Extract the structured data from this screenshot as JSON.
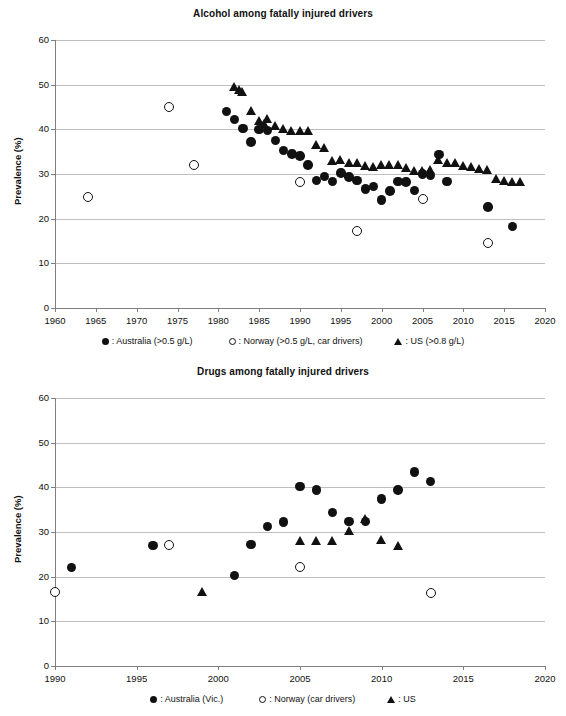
{
  "charts": [
    {
      "id": "alcohol",
      "title": "Alcohol among fatally injured drivers",
      "ylabel": "Prevalence (%)",
      "xlabel": "",
      "ylim": [
        0,
        60
      ],
      "xlim": [
        1960,
        2020
      ],
      "yticks": [
        "0",
        "10",
        "20",
        "30",
        "40",
        "50",
        "60"
      ],
      "xticks": [
        "1960",
        "1965",
        "1970",
        "1975",
        "1980",
        "1985",
        "1990",
        "1995",
        "2000",
        "2005",
        "2010",
        "2015",
        "2020"
      ],
      "legend": [
        {
          "marker": "circle-filled",
          "label": ": Australia (>0.5 g/L)"
        },
        {
          "marker": "circle-open",
          "label": ": Norway (>0.5 g/L, car drivers)"
        },
        {
          "marker": "triangle",
          "label": ": US (>0.8 g/L)"
        }
      ]
    },
    {
      "id": "drugs",
      "title": "Drugs among fatally injured drivers",
      "ylabel": "Prevalence (%)",
      "xlabel": "",
      "ylim": [
        0,
        60
      ],
      "xlim": [
        1990,
        2020
      ],
      "yticks": [
        "0",
        "10",
        "20",
        "30",
        "40",
        "50",
        "60"
      ],
      "xticks": [
        "1990",
        "1995",
        "2000",
        "2005",
        "2010",
        "2015",
        "2020"
      ],
      "legend": [
        {
          "marker": "circle-filled",
          "label": ": Australia (Vic.)"
        },
        {
          "marker": "circle-open",
          "label": ": Norway (car drivers)"
        },
        {
          "marker": "triangle",
          "label": ": US"
        }
      ]
    }
  ],
  "chart_data": [
    {
      "type": "scatter",
      "title": "Alcohol among fatally injured drivers",
      "xlabel": "",
      "ylabel": "Prevalence (%)",
      "xlim": [
        1960,
        2020
      ],
      "ylim": [
        0,
        60
      ],
      "grid": true,
      "legend_position": "below",
      "series": [
        {
          "name": "Australia (>0.5 g/L)",
          "marker": "circle-filled",
          "color": "#111111",
          "points": [
            [
              1981,
              44.0
            ],
            [
              1982,
              42.2
            ],
            [
              1983,
              40.2
            ],
            [
              1984,
              37.2
            ],
            [
              1985,
              40.0
            ],
            [
              1986,
              39.8
            ],
            [
              1987,
              37.5
            ],
            [
              1988,
              35.2
            ],
            [
              1989,
              34.5
            ],
            [
              1990,
              34.0
            ],
            [
              1991,
              32.0
            ],
            [
              1992,
              28.6
            ],
            [
              1993,
              29.5
            ],
            [
              1994,
              28.3
            ],
            [
              1995,
              30.2
            ],
            [
              1996,
              29.3
            ],
            [
              1997,
              28.5
            ],
            [
              1998,
              26.6
            ],
            [
              1999,
              27.2
            ],
            [
              2000,
              24.2
            ],
            [
              2001,
              26.2
            ],
            [
              2002,
              28.3
            ],
            [
              2003,
              28.2
            ],
            [
              2004,
              26.3
            ],
            [
              2005,
              30.0
            ],
            [
              2006,
              29.6
            ],
            [
              2007,
              34.3
            ],
            [
              2008,
              28.3
            ],
            [
              2013,
              22.6
            ],
            [
              2016,
              18.3
            ]
          ]
        },
        {
          "name": "Norway (>0.5 g/L, car drivers)",
          "marker": "circle-open",
          "color": "#111111",
          "points": [
            [
              1964,
              24.8
            ],
            [
              1974,
              45.0
            ],
            [
              1977,
              32.0
            ],
            [
              1990,
              28.2
            ],
            [
              1997,
              17.2
            ],
            [
              2005,
              24.3
            ],
            [
              2013,
              14.5
            ]
          ]
        },
        {
          "name": "US (>0.8 g/L)",
          "marker": "triangle",
          "color": "#111111",
          "points": [
            [
              1982,
              49.5
            ],
            [
              1982.6,
              48.8
            ],
            [
              1983,
              48.5
            ],
            [
              1984,
              44.2
            ],
            [
              1985,
              42.0
            ],
            [
              1985.6,
              41.3
            ],
            [
              1986,
              42.4
            ],
            [
              1987,
              40.8
            ],
            [
              1988,
              40.2
            ],
            [
              1989,
              39.8
            ],
            [
              1990,
              39.8
            ],
            [
              1991,
              39.8
            ],
            [
              1992,
              36.5
            ],
            [
              1993,
              36.0
            ],
            [
              1994,
              33.0
            ],
            [
              1995,
              33.3
            ],
            [
              1996,
              32.5
            ],
            [
              1997,
              32.6
            ],
            [
              1998,
              31.8
            ],
            [
              1999,
              31.6
            ],
            [
              2000,
              32.0
            ],
            [
              2001,
              32.0
            ],
            [
              2002,
              32.0
            ],
            [
              2003,
              31.3
            ],
            [
              2004,
              30.8
            ],
            [
              2005,
              30.8
            ],
            [
              2006,
              31.0
            ],
            [
              2007,
              33.2
            ],
            [
              2008,
              32.6
            ],
            [
              2009,
              32.5
            ],
            [
              2010,
              31.8
            ],
            [
              2011,
              31.6
            ],
            [
              2012,
              31.2
            ],
            [
              2013,
              31.0
            ],
            [
              2014,
              29.0
            ],
            [
              2015,
              28.5
            ],
            [
              2016,
              28.2
            ],
            [
              2017,
              28.2
            ]
          ]
        }
      ]
    },
    {
      "type": "scatter",
      "title": "Drugs among fatally injured drivers",
      "xlabel": "",
      "ylabel": "Prevalence (%)",
      "xlim": [
        1990,
        2020
      ],
      "ylim": [
        0,
        60
      ],
      "grid": true,
      "legend_position": "below",
      "series": [
        {
          "name": "Australia (Vic.)",
          "marker": "circle-filled",
          "color": "#111111",
          "points": [
            [
              1991,
              22.0
            ],
            [
              1996,
              27.0
            ],
            [
              2001,
              20.2
            ],
            [
              2002,
              27.2
            ],
            [
              2003,
              31.2
            ],
            [
              2004,
              32.2
            ],
            [
              2005,
              40.2
            ],
            [
              2006,
              39.4
            ],
            [
              2007,
              34.4
            ],
            [
              2008,
              32.4
            ],
            [
              2009,
              32.4
            ],
            [
              2010,
              37.4
            ],
            [
              2011,
              39.4
            ],
            [
              2012,
              43.4
            ],
            [
              2013,
              41.3
            ]
          ]
        },
        {
          "name": "Norway (car drivers)",
          "marker": "circle-open",
          "color": "#111111",
          "points": [
            [
              1990,
              16.5
            ],
            [
              1997,
              27.1
            ],
            [
              2005,
              22.1
            ],
            [
              2013,
              16.4
            ]
          ]
        },
        {
          "name": "US",
          "marker": "triangle",
          "color": "#111111",
          "points": [
            [
              1999,
              16.7
            ],
            [
              2005,
              28.0
            ],
            [
              2006,
              28.0
            ],
            [
              2007,
              28.0
            ],
            [
              2008,
              30.2
            ],
            [
              2009,
              33.0
            ],
            [
              2010,
              28.3
            ],
            [
              2011,
              27.0
            ]
          ]
        }
      ]
    }
  ]
}
